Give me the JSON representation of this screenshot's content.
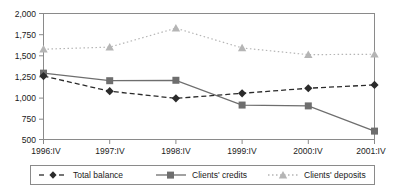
{
  "chart_data": {
    "type": "line",
    "title": "",
    "xlabel": "",
    "ylabel": "",
    "categories": [
      "1996:IV",
      "1997:IV",
      "1998:IV",
      "1999:IV",
      "2000:IV",
      "2001:IV"
    ],
    "ylim": [
      500,
      2000
    ],
    "yticks": [
      500,
      750,
      1000,
      1250,
      1500,
      1750,
      2000
    ],
    "ytick_labels": [
      "500",
      "750",
      "1,000",
      "1,250",
      "1,500",
      "1,750",
      "2,000"
    ],
    "grid": false,
    "legend_position": "bottom",
    "series": [
      {
        "name": "Total balance",
        "values": [
          1255,
          1075,
          990,
          1050,
          1110,
          1150
        ],
        "marker": "diamond",
        "line_style": "dashed",
        "color": "#2b2b2b"
      },
      {
        "name": "Clients' credits",
        "values": [
          1290,
          1200,
          1205,
          910,
          900,
          600
        ],
        "marker": "square",
        "line_style": "solid",
        "color": "#6e6e6e"
      },
      {
        "name": "Clients' deposits",
        "values": [
          1575,
          1600,
          1825,
          1590,
          1510,
          1515
        ],
        "marker": "triangle",
        "line_style": "dotted",
        "color": "#b5b5b5"
      }
    ]
  },
  "axis": {
    "y_tick_0": "500",
    "y_tick_1": "750",
    "y_tick_2": "1,000",
    "y_tick_3": "1,250",
    "y_tick_4": "1,500",
    "y_tick_5": "1,750",
    "y_tick_6": "2,000",
    "x_tick_0": "1996:IV",
    "x_tick_1": "1997:IV",
    "x_tick_2": "1998:IV",
    "x_tick_3": "1999:IV",
    "x_tick_4": "2000:IV",
    "x_tick_5": "2001:IV"
  },
  "legend": {
    "item_0": "Total balance",
    "item_1": "Clients' credits",
    "item_2": "Clients' deposits"
  },
  "colors": {
    "axis": "#8a8a8a",
    "series_total_balance": "#2b2b2b",
    "series_clients_credits": "#6e6e6e",
    "series_clients_deposits": "#b5b5b5",
    "legend_border": "#8a8a8a",
    "text": "#1a1a1a"
  }
}
